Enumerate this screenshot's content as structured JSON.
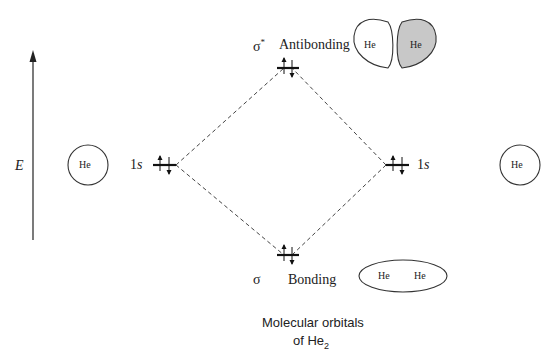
{
  "diagram": {
    "title_line1": "Molecular orbitals",
    "title_line2_prefix": "of He",
    "title_line2_sub": "2",
    "energy_axis_label": "E",
    "left_atom": {
      "label": "He",
      "orbital": "1s",
      "orbital_num": "1",
      "orbital_letter": "s"
    },
    "right_atom": {
      "label": "He",
      "orbital": "1s",
      "orbital_num": "1",
      "orbital_letter": "s"
    },
    "antibonding": {
      "symbol": "σ",
      "superscript": "*",
      "label": "Antibonding",
      "lobe_left": "He",
      "lobe_right": "He",
      "shaded_color": "#c8c8c8"
    },
    "bonding": {
      "symbol": "σ",
      "label": "Bonding",
      "atom1": "He",
      "atom2": "He"
    },
    "electrons": {
      "left_1s": "↑↓",
      "right_1s": "↑↓",
      "sigma": "↑↓",
      "sigma_star": "↑↓"
    },
    "line_color": "#333333"
  }
}
